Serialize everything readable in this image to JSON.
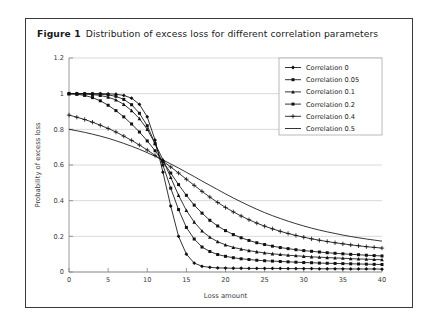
{
  "caption": {
    "number": "Figure 1",
    "text": "Distribution of excess loss for different correlation parameters"
  },
  "chart_data": {
    "type": "line",
    "title": "",
    "xlabel": "Loss amount",
    "ylabel": "Probability of excess loss",
    "xlim": [
      0,
      40
    ],
    "ylim": [
      0,
      1.2
    ],
    "xticks": [
      0,
      5,
      10,
      15,
      20,
      25,
      30,
      35,
      40
    ],
    "xtick_labels": [
      "0",
      "5",
      "10",
      "15",
      "20",
      "25",
      "30",
      "35",
      "40"
    ],
    "yticks": [
      0,
      0.2,
      0.4,
      0.6,
      0.8,
      1,
      1.2
    ],
    "ytick_labels": [
      "0",
      "0.2",
      "0.4",
      "0.6",
      "0.8",
      "1",
      "1.2"
    ],
    "grid": "horizontal",
    "legend_position": "top-right",
    "x": [
      0,
      1,
      2,
      3,
      4,
      5,
      6,
      7,
      8,
      9,
      10,
      11,
      12,
      13,
      14,
      15,
      16,
      17,
      18,
      19,
      20,
      21,
      22,
      23,
      24,
      25,
      26,
      27,
      28,
      29,
      30,
      31,
      32,
      33,
      34,
      35,
      36,
      37,
      38,
      39,
      40
    ],
    "series": [
      {
        "name": "Correlation 0",
        "marker": "diamond",
        "values": [
          1,
          1,
          1,
          1,
          1,
          0.999,
          0.997,
          0.99,
          0.975,
          0.94,
          0.87,
          0.74,
          0.56,
          0.37,
          0.2,
          0.1,
          0.05,
          0.032,
          0.026,
          0.023,
          0.022,
          0.021,
          0.021,
          0.02,
          0.02,
          0.02,
          0.02,
          0.02,
          0.019,
          0.019,
          0.019,
          0.019,
          0.018,
          0.018,
          0.018,
          0.018,
          0.017,
          0.017,
          0.017,
          0.017,
          0.016
        ]
      },
      {
        "name": "Correlation 0.05",
        "marker": "square",
        "values": [
          1,
          1,
          1,
          0.999,
          0.997,
          0.993,
          0.985,
          0.968,
          0.938,
          0.89,
          0.82,
          0.72,
          0.6,
          0.47,
          0.35,
          0.25,
          0.185,
          0.14,
          0.115,
          0.098,
          0.088,
          0.08,
          0.074,
          0.07,
          0.066,
          0.063,
          0.061,
          0.059,
          0.057,
          0.055,
          0.053,
          0.052,
          0.05,
          0.049,
          0.048,
          0.047,
          0.046,
          0.045,
          0.044,
          0.043,
          0.042
        ]
      },
      {
        "name": "Correlation 0.1",
        "marker": "triangle",
        "values": [
          1,
          0.999,
          0.998,
          0.995,
          0.99,
          0.98,
          0.965,
          0.94,
          0.905,
          0.86,
          0.8,
          0.72,
          0.63,
          0.53,
          0.43,
          0.345,
          0.28,
          0.23,
          0.195,
          0.17,
          0.152,
          0.138,
          0.128,
          0.12,
          0.113,
          0.107,
          0.102,
          0.098,
          0.094,
          0.091,
          0.088,
          0.085,
          0.083,
          0.081,
          0.079,
          0.077,
          0.075,
          0.073,
          0.072,
          0.07,
          0.069
        ]
      },
      {
        "name": "Correlation 0.2",
        "marker": "square",
        "values": [
          1,
          0.997,
          0.99,
          0.978,
          0.96,
          0.935,
          0.905,
          0.87,
          0.83,
          0.785,
          0.735,
          0.68,
          0.62,
          0.555,
          0.49,
          0.43,
          0.375,
          0.33,
          0.29,
          0.258,
          0.232,
          0.21,
          0.192,
          0.177,
          0.164,
          0.154,
          0.145,
          0.137,
          0.131,
          0.125,
          0.12,
          0.116,
          0.112,
          0.108,
          0.105,
          0.102,
          0.099,
          0.097,
          0.094,
          0.092,
          0.09
        ]
      },
      {
        "name": "Correlation 0.4",
        "marker": "plus",
        "values": [
          0.88,
          0.868,
          0.855,
          0.84,
          0.823,
          0.805,
          0.785,
          0.762,
          0.738,
          0.712,
          0.684,
          0.654,
          0.622,
          0.589,
          0.555,
          0.52,
          0.486,
          0.452,
          0.42,
          0.39,
          0.362,
          0.337,
          0.314,
          0.293,
          0.274,
          0.257,
          0.242,
          0.228,
          0.216,
          0.205,
          0.195,
          0.186,
          0.178,
          0.171,
          0.164,
          0.158,
          0.152,
          0.147,
          0.142,
          0.138,
          0.134
        ]
      },
      {
        "name": "Correlation 0.5",
        "marker": "none",
        "values": [
          0.8,
          0.792,
          0.783,
          0.773,
          0.762,
          0.75,
          0.736,
          0.721,
          0.705,
          0.688,
          0.669,
          0.649,
          0.628,
          0.606,
          0.583,
          0.559,
          0.535,
          0.51,
          0.486,
          0.462,
          0.438,
          0.415,
          0.393,
          0.372,
          0.352,
          0.333,
          0.316,
          0.3,
          0.285,
          0.271,
          0.258,
          0.246,
          0.235,
          0.225,
          0.216,
          0.207,
          0.199,
          0.192,
          0.185,
          0.179,
          0.173
        ]
      }
    ]
  }
}
